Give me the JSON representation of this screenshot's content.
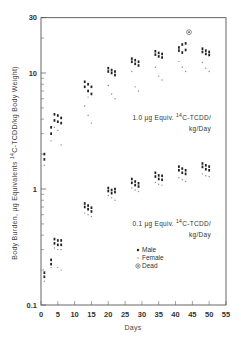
{
  "chart_data": {
    "type": "scatter",
    "title": "",
    "xlabel": "Days",
    "ylabel": "Body Burden, µg Equivalents 14C-TCDD/kg Body Weight",
    "ylabel_parts": {
      "pre": "Body Burden, µg Equivalents ",
      "sup": "14",
      "post": "C-TCDD/kg Body Weight)"
    },
    "xlim": [
      0,
      55
    ],
    "ylim": [
      0.1,
      30
    ],
    "yscale": "log",
    "grid": false,
    "x_ticks": [
      0,
      5,
      10,
      15,
      20,
      25,
      30,
      35,
      40,
      45,
      50,
      55
    ],
    "x_tick_labels": [
      "0",
      "5",
      "10",
      "15",
      "20",
      "25",
      "30",
      "35",
      "40",
      "45",
      "50",
      "55"
    ],
    "y_tick_labels": [
      {
        "value": 0.1,
        "label": "0.1"
      },
      {
        "value": 1,
        "label": "1"
      },
      {
        "value": 10,
        "label": "10"
      },
      {
        "value": 30,
        "label": "30"
      }
    ],
    "y_minor_ticks": [
      0.2,
      0.3,
      0.4,
      0.5,
      0.6,
      0.7,
      0.8,
      0.9,
      2,
      3,
      4,
      5,
      6,
      7,
      8,
      9,
      20
    ],
    "annotations": [
      {
        "id": "high",
        "line1_pre": "1.0 µg Equiv. ",
        "sup": "14",
        "line1_post": "C-TCDD/",
        "line2": "kg/Day"
      },
      {
        "id": "low",
        "line1_pre": "0.1 µg Equiv. ",
        "sup": "14",
        "line1_post": "C-TCDD/",
        "line2": "kg/Day"
      }
    ],
    "legend": {
      "position": "lower-right-inside",
      "entries": [
        {
          "name": "Male",
          "marker": "dot"
        },
        {
          "name": "Female",
          "marker": "small-dot"
        },
        {
          "name": "Dead",
          "marker": "circled-dot"
        }
      ]
    },
    "series": [
      {
        "name": "1.0 µg Equiv. 14C-TCDD/kg/Day — Male",
        "marker": "dot",
        "points": [
          {
            "x": 1,
            "y": 1.8
          },
          {
            "x": 1,
            "y": 2.0
          },
          {
            "x": 3,
            "y": 3.0
          },
          {
            "x": 3,
            "y": 3.4
          },
          {
            "x": 4,
            "y": 3.9
          },
          {
            "x": 4,
            "y": 4.4
          },
          {
            "x": 5,
            "y": 3.8
          },
          {
            "x": 5,
            "y": 4.3
          },
          {
            "x": 6,
            "y": 3.7
          },
          {
            "x": 6,
            "y": 4.1
          },
          {
            "x": 13,
            "y": 7.6
          },
          {
            "x": 13,
            "y": 8.4
          },
          {
            "x": 14,
            "y": 7.0
          },
          {
            "x": 14,
            "y": 8.0
          },
          {
            "x": 15,
            "y": 6.6
          },
          {
            "x": 15,
            "y": 7.6
          },
          {
            "x": 20,
            "y": 10.3
          },
          {
            "x": 20,
            "y": 11.0
          },
          {
            "x": 21,
            "y": 10.0
          },
          {
            "x": 21,
            "y": 10.6
          },
          {
            "x": 22,
            "y": 9.6
          },
          {
            "x": 22,
            "y": 10.3
          },
          {
            "x": 27,
            "y": 12.5
          },
          {
            "x": 27,
            "y": 13.3
          },
          {
            "x": 28,
            "y": 12.0
          },
          {
            "x": 28,
            "y": 12.9
          },
          {
            "x": 29,
            "y": 11.6
          },
          {
            "x": 29,
            "y": 12.5
          },
          {
            "x": 34,
            "y": 14.4
          },
          {
            "x": 34,
            "y": 15.4
          },
          {
            "x": 35,
            "y": 13.9
          },
          {
            "x": 35,
            "y": 14.9
          },
          {
            "x": 36,
            "y": 13.6
          },
          {
            "x": 36,
            "y": 14.6
          },
          {
            "x": 41,
            "y": 15.6
          },
          {
            "x": 41,
            "y": 16.6
          },
          {
            "x": 42,
            "y": 17.6
          },
          {
            "x": 42,
            "y": 15.0
          },
          {
            "x": 43,
            "y": 18.0
          },
          {
            "x": 43,
            "y": 15.8
          },
          {
            "x": 48,
            "y": 15.2
          },
          {
            "x": 48,
            "y": 16.2
          },
          {
            "x": 49,
            "y": 14.6
          },
          {
            "x": 49,
            "y": 15.6
          },
          {
            "x": 50,
            "y": 14.3
          },
          {
            "x": 50,
            "y": 15.2
          }
        ]
      },
      {
        "name": "1.0 µg Equiv. 14C-TCDD/kg/Day — Female",
        "marker": "small-dot",
        "points": [
          {
            "x": 1,
            "y": 1.6
          },
          {
            "x": 3,
            "y": 2.6
          },
          {
            "x": 4,
            "y": 3.4
          },
          {
            "x": 5,
            "y": 3.2
          },
          {
            "x": 6,
            "y": 2.4
          },
          {
            "x": 13,
            "y": 5.2
          },
          {
            "x": 14,
            "y": 4.3
          },
          {
            "x": 14,
            "y": 6.2
          },
          {
            "x": 15,
            "y": 3.7
          },
          {
            "x": 20,
            "y": 7.8
          },
          {
            "x": 21,
            "y": 6.6
          },
          {
            "x": 22,
            "y": 6.0
          },
          {
            "x": 27,
            "y": 10.3
          },
          {
            "x": 28,
            "y": 7.6
          },
          {
            "x": 29,
            "y": 7.0
          },
          {
            "x": 34,
            "y": 11.2
          },
          {
            "x": 35,
            "y": 9.4
          },
          {
            "x": 36,
            "y": 8.7
          },
          {
            "x": 41,
            "y": 12.6
          },
          {
            "x": 42,
            "y": 11.2
          },
          {
            "x": 43,
            "y": 10.3
          },
          {
            "x": 48,
            "y": 12.3
          },
          {
            "x": 49,
            "y": 11.0
          },
          {
            "x": 50,
            "y": 10.3
          }
        ]
      },
      {
        "name": "1.0 µg Equiv. 14C-TCDD/kg/Day — Dead",
        "marker": "circled-dot",
        "points": [
          {
            "x": 44,
            "y": 22.5
          }
        ]
      },
      {
        "name": "0.1 µg Equiv. 14C-TCDD/kg/Day — Male",
        "marker": "dot",
        "points": [
          {
            "x": 1,
            "y": 0.175
          },
          {
            "x": 1,
            "y": 0.19
          },
          {
            "x": 3,
            "y": 0.225
          },
          {
            "x": 3,
            "y": 0.245
          },
          {
            "x": 4,
            "y": 0.34
          },
          {
            "x": 4,
            "y": 0.37
          },
          {
            "x": 5,
            "y": 0.33
          },
          {
            "x": 5,
            "y": 0.36
          },
          {
            "x": 6,
            "y": 0.33
          },
          {
            "x": 6,
            "y": 0.36
          },
          {
            "x": 13,
            "y": 0.7
          },
          {
            "x": 13,
            "y": 0.75
          },
          {
            "x": 14,
            "y": 0.67
          },
          {
            "x": 14,
            "y": 0.72
          },
          {
            "x": 15,
            "y": 0.64
          },
          {
            "x": 15,
            "y": 0.69
          },
          {
            "x": 20,
            "y": 0.96
          },
          {
            "x": 20,
            "y": 1.02
          },
          {
            "x": 21,
            "y": 0.92
          },
          {
            "x": 21,
            "y": 0.98
          },
          {
            "x": 22,
            "y": 0.94
          },
          {
            "x": 22,
            "y": 1.0
          },
          {
            "x": 27,
            "y": 1.13
          },
          {
            "x": 27,
            "y": 1.22
          },
          {
            "x": 28,
            "y": 1.08
          },
          {
            "x": 28,
            "y": 1.16
          },
          {
            "x": 29,
            "y": 1.05
          },
          {
            "x": 29,
            "y": 1.12
          },
          {
            "x": 34,
            "y": 1.28
          },
          {
            "x": 34,
            "y": 1.38
          },
          {
            "x": 35,
            "y": 1.22
          },
          {
            "x": 35,
            "y": 1.31
          },
          {
            "x": 36,
            "y": 1.2
          },
          {
            "x": 36,
            "y": 1.3
          },
          {
            "x": 41,
            "y": 1.45
          },
          {
            "x": 41,
            "y": 1.56
          },
          {
            "x": 42,
            "y": 1.38
          },
          {
            "x": 42,
            "y": 1.5
          },
          {
            "x": 43,
            "y": 1.35
          },
          {
            "x": 43,
            "y": 1.45
          },
          {
            "x": 48,
            "y": 1.55
          },
          {
            "x": 48,
            "y": 1.66
          },
          {
            "x": 49,
            "y": 1.48
          },
          {
            "x": 49,
            "y": 1.6
          },
          {
            "x": 50,
            "y": 1.45
          },
          {
            "x": 50,
            "y": 1.56
          }
        ]
      },
      {
        "name": "0.1 µg Equiv. 14C-TCDD/kg/Day — Female",
        "marker": "small-dot",
        "points": [
          {
            "x": 1,
            "y": 0.16
          },
          {
            "x": 3,
            "y": 0.21
          },
          {
            "x": 5,
            "y": 0.21
          },
          {
            "x": 6,
            "y": 0.2
          },
          {
            "x": 4,
            "y": 0.31
          },
          {
            "x": 5,
            "y": 0.3
          },
          {
            "x": 6,
            "y": 0.3
          },
          {
            "x": 13,
            "y": 0.62
          },
          {
            "x": 14,
            "y": 0.6
          },
          {
            "x": 15,
            "y": 0.58
          },
          {
            "x": 20,
            "y": 0.88
          },
          {
            "x": 21,
            "y": 0.84
          },
          {
            "x": 22,
            "y": 0.8
          },
          {
            "x": 27,
            "y": 1.02
          },
          {
            "x": 28,
            "y": 0.98
          },
          {
            "x": 29,
            "y": 0.95
          },
          {
            "x": 34,
            "y": 1.14
          },
          {
            "x": 35,
            "y": 1.1
          },
          {
            "x": 36,
            "y": 1.08
          },
          {
            "x": 41,
            "y": 1.25
          },
          {
            "x": 42,
            "y": 1.2
          },
          {
            "x": 43,
            "y": 1.16
          },
          {
            "x": 48,
            "y": 1.35
          },
          {
            "x": 49,
            "y": 1.3
          },
          {
            "x": 50,
            "y": 1.28
          }
        ]
      }
    ]
  }
}
